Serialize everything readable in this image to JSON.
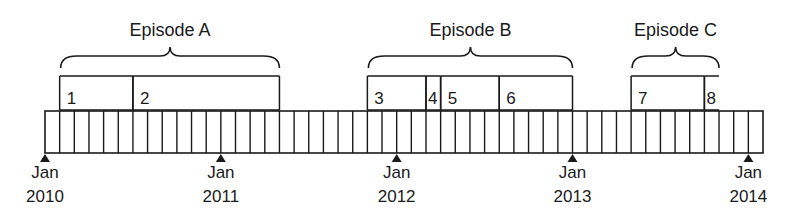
{
  "diagram": {
    "timeline": {
      "start_x": 45,
      "end_x": 763,
      "top_y": 111,
      "bottom_y": 153,
      "cells": 49,
      "cell_width": 14.65,
      "stroke": "#1a1a1a"
    },
    "markers": [
      {
        "cell": 0,
        "month": "Jan",
        "year": "2010"
      },
      {
        "cell": 12,
        "month": "Jan",
        "year": "2011"
      },
      {
        "cell": 24,
        "month": "Jan",
        "year": "2012"
      },
      {
        "cell": 36,
        "month": "Jan",
        "year": "2013"
      },
      {
        "cell": 48,
        "month": "Jan",
        "year": "2014"
      }
    ],
    "episodes": [
      {
        "label": "Episode A",
        "start_cell": 1,
        "end_cell": 16
      },
      {
        "label": "Episode B",
        "start_cell": 22,
        "end_cell": 36
      },
      {
        "label": "Episode C",
        "start_cell": 40,
        "end_cell": 46
      }
    ],
    "segments": [
      {
        "label": "1",
        "start_cell": 1,
        "end_cell": 6,
        "open_right": false
      },
      {
        "label": "2",
        "start_cell": 6,
        "end_cell": 16,
        "open_right": false
      },
      {
        "label": "3",
        "start_cell": 22,
        "end_cell": 26,
        "open_right": false
      },
      {
        "label": "4",
        "start_cell": 26,
        "end_cell": 27,
        "open_right": false
      },
      {
        "label": "5",
        "start_cell": 27,
        "end_cell": 31,
        "open_right": false
      },
      {
        "label": "6",
        "start_cell": 31,
        "end_cell": 36,
        "open_right": false
      },
      {
        "label": "7",
        "start_cell": 40,
        "end_cell": 45,
        "open_right": false
      },
      {
        "label": "8",
        "start_cell": 45,
        "end_cell": 46,
        "open_right": true
      }
    ],
    "segment_box": {
      "top_y": 76,
      "bottom_y": 110
    }
  }
}
